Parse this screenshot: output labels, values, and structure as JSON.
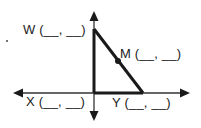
{
  "diagram": {
    "type": "coordinate-plane-triangle",
    "colors": {
      "line": "#1a1a1a",
      "axis": "#333333",
      "text": "#222222",
      "background": "#ffffff"
    },
    "axes": {
      "x_axis": {
        "arrows": [
          "left",
          "right"
        ]
      },
      "y_axis": {
        "arrows": [
          "up",
          "down"
        ]
      }
    },
    "points": [
      {
        "name": "W",
        "label": "W (__, __)",
        "position": "top of vertical leg, on y-axis"
      },
      {
        "name": "M",
        "label": "M (__, __)",
        "position": "midpoint of hypotenuse WY"
      },
      {
        "name": "X",
        "label": "X (__, __)",
        "position": "origin, right-angle vertex"
      },
      {
        "name": "Y",
        "label": "Y (__, __)",
        "position": "on x-axis, right of origin"
      }
    ],
    "segments": [
      "WX",
      "XY",
      "WY"
    ],
    "stray_mark": "."
  }
}
